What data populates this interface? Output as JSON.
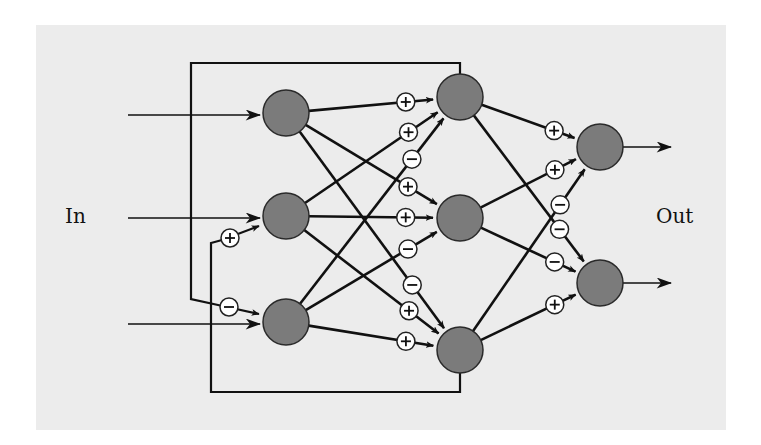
{
  "labels": {
    "input": "In",
    "output": "Out"
  },
  "colors": {
    "panel": "#ececec",
    "node": "#7b7b7b",
    "line": "#111111",
    "sign_bg": "#ffffff"
  },
  "nodes": {
    "input": [
      {
        "id": "i1",
        "x": 286,
        "y": 113
      },
      {
        "id": "i2",
        "x": 286,
        "y": 216
      },
      {
        "id": "i3",
        "x": 286,
        "y": 322
      }
    ],
    "hidden": [
      {
        "id": "h1",
        "x": 460,
        "y": 97
      },
      {
        "id": "h2",
        "x": 460,
        "y": 218
      },
      {
        "id": "h3",
        "x": 460,
        "y": 350
      }
    ],
    "output": [
      {
        "id": "o1",
        "x": 600,
        "y": 147
      },
      {
        "id": "o2",
        "x": 600,
        "y": 283
      }
    ]
  },
  "node_radius": 23,
  "connections": [
    {
      "from": "i1",
      "to": "h1",
      "sign": "+"
    },
    {
      "from": "i2",
      "to": "h1",
      "sign": "+"
    },
    {
      "from": "i3",
      "to": "h1",
      "sign": "-"
    },
    {
      "from": "i1",
      "to": "h2",
      "sign": "+"
    },
    {
      "from": "i2",
      "to": "h2",
      "sign": "+"
    },
    {
      "from": "i3",
      "to": "h2",
      "sign": "-"
    },
    {
      "from": "i1",
      "to": "h3",
      "sign": "-"
    },
    {
      "from": "i2",
      "to": "h3",
      "sign": "+"
    },
    {
      "from": "i3",
      "to": "h3",
      "sign": "+"
    },
    {
      "from": "h1",
      "to": "o1",
      "sign": "+"
    },
    {
      "from": "h2",
      "to": "o1",
      "sign": "+"
    },
    {
      "from": "h3",
      "to": "o1",
      "sign": "-"
    },
    {
      "from": "h1",
      "to": "o2",
      "sign": "-"
    },
    {
      "from": "h2",
      "to": "o2",
      "sign": "-"
    },
    {
      "from": "h3",
      "to": "o2",
      "sign": "+"
    }
  ],
  "feedback": [
    {
      "from": "h1",
      "to": "i3",
      "sign": "-",
      "description": "top loop from hidden node 1 back to input node 3"
    },
    {
      "from": "h3",
      "to": "i2",
      "sign": "+",
      "description": "bottom loop from hidden node 3 back to input node 2"
    }
  ],
  "external_inputs": 3,
  "external_outputs": 2
}
